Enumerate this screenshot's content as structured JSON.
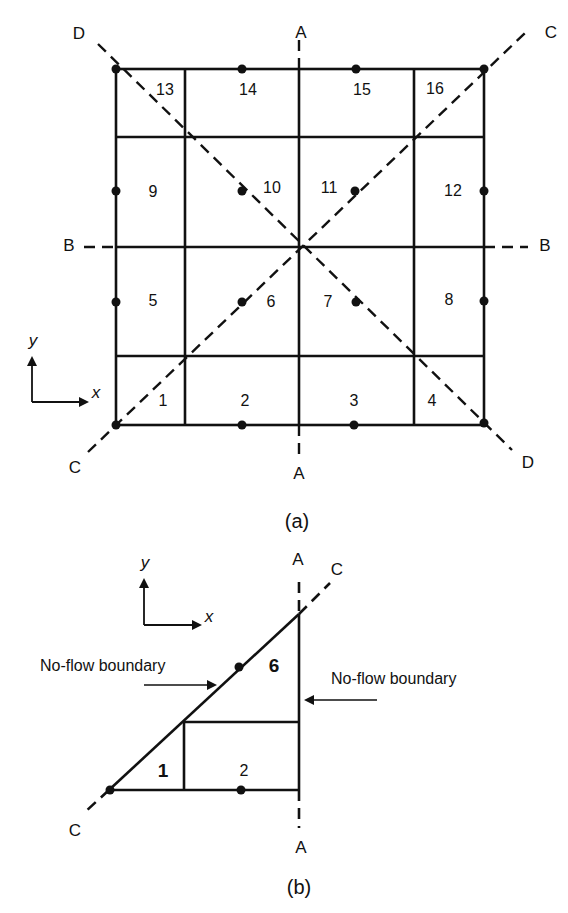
{
  "figure_a": {
    "caption": "(a)",
    "symmetry_lines": {
      "A_top": "A",
      "A_bottom": "A",
      "B_left": "B",
      "B_right": "B",
      "C_top": "C",
      "C_bottom": "C",
      "D_top": "D",
      "D_bottom": "D"
    },
    "axes": {
      "x": "x",
      "y": "y"
    },
    "blocks": [
      "1",
      "2",
      "3",
      "4",
      "5",
      "6",
      "7",
      "8",
      "9",
      "10",
      "11",
      "12",
      "13",
      "14",
      "15",
      "16"
    ]
  },
  "figure_b": {
    "caption": "(b)",
    "symmetry_lines": {
      "A_top": "A",
      "A_bottom": "A",
      "C_top": "C",
      "C_bottom": "C"
    },
    "axes": {
      "x": "x",
      "y": "y"
    },
    "blocks": [
      "1",
      "2",
      "6"
    ],
    "annotations": {
      "left": "No-flow boundary",
      "right": "No-flow boundary"
    }
  }
}
